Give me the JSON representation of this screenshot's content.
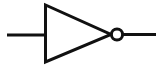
{
  "diagram": {
    "symbol_name": "not-gate",
    "standard": "distinctive-shape",
    "canvas": {
      "width": 163,
      "height": 70,
      "background_color": "#ffffff"
    },
    "style": {
      "stroke_color": "#111111",
      "fill_color": "#ffffff",
      "wire_stroke_width": 3,
      "body_stroke_width": 3,
      "bubble_stroke_width": 3
    },
    "parts": {
      "input_wire": {
        "label": "input-wire",
        "x1": 7,
        "y1": 35,
        "x2": 46,
        "y2": 35
      },
      "back_bar": {
        "label": "gate-back-bar",
        "x1": 45.5,
        "y1": 5,
        "x2": 45.5,
        "y2": 62
      },
      "triangle": {
        "label": "gate-triangle",
        "points": "45.5,5 45.5,62 111,34.5",
        "apex_x": 111,
        "apex_y": 34.5,
        "fill": "#ffffff"
      },
      "bubble": {
        "label": "inversion-bubble",
        "cx": 117,
        "cy": 34.5,
        "r": 5.6,
        "fill": "#ffffff"
      },
      "output_wire": {
        "label": "output-wire",
        "x1": 122.5,
        "y1": 34.5,
        "x2": 156,
        "y2": 34.5
      }
    }
  }
}
